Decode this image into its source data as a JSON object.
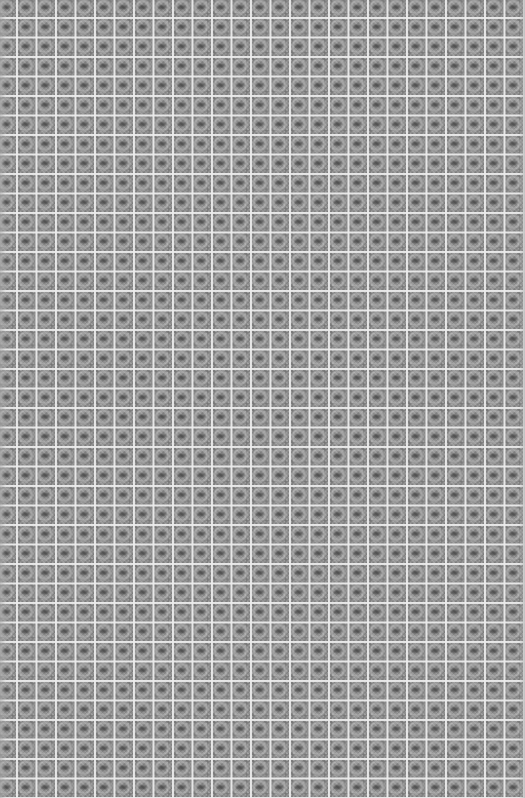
{
  "image": {
    "kind": "tiled-texture",
    "description": "Seamless repeating gray patterned tiles separated by light grid lines",
    "width": 525,
    "height": 798,
    "tile_pitch_px": 19.5,
    "approx_columns": 27,
    "approx_rows": 41,
    "colors": {
      "tile_base": "#8f8f8f",
      "grid_line": "#ebebeb",
      "motif_dark": "#3c3c3c",
      "motif_light": "#c8c8c8"
    }
  }
}
